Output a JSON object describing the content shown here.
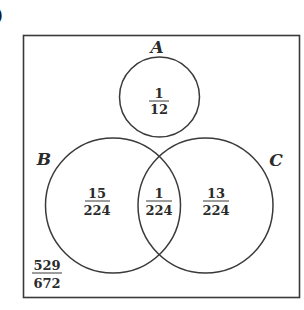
{
  "corner_mark": ")",
  "diagram": {
    "type": "venn",
    "universe": {
      "label": "",
      "outside_probability": {
        "numerator": "529",
        "denominator": "672"
      }
    },
    "sets": [
      {
        "name": "A",
        "label": "A"
      },
      {
        "name": "B",
        "label": "B"
      },
      {
        "name": "C",
        "label": "C"
      }
    ],
    "regions": {
      "A_only": {
        "numerator": "1",
        "denominator": "12"
      },
      "B_only": {
        "numerator": "15",
        "denominator": "224"
      },
      "B_and_C": {
        "numerator": "1",
        "denominator": "224"
      },
      "C_only": {
        "numerator": "13",
        "denominator": "224"
      },
      "outside": {
        "numerator": "529",
        "denominator": "672"
      }
    },
    "colors": {
      "stroke": "#3a3a3a",
      "text": "#2b2b2b",
      "background": "#ffffff"
    }
  }
}
